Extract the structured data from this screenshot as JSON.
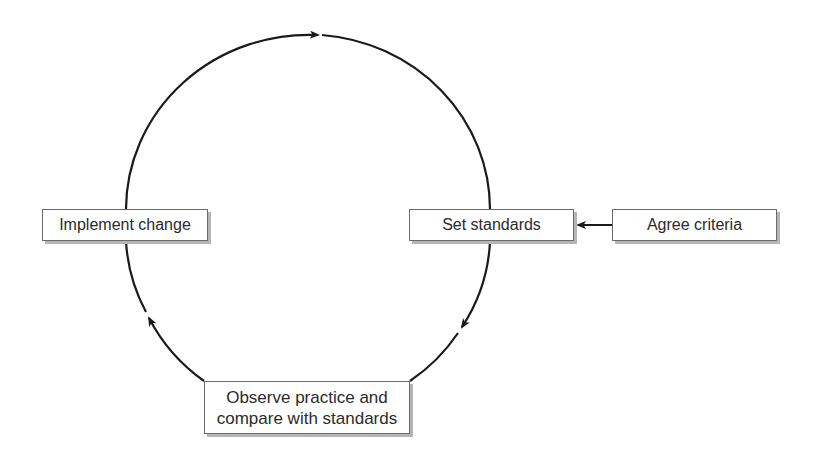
{
  "diagram": {
    "type": "cycle",
    "nodes": [
      {
        "id": "set_standards",
        "label": "Set standards"
      },
      {
        "id": "observe_practice",
        "label": "Observe practice and compare with standards",
        "lines": [
          "Observe practice and",
          "compare with standards"
        ]
      },
      {
        "id": "implement_change",
        "label": "Implement change"
      },
      {
        "id": "agree_criteria",
        "label": "Agree criteria"
      }
    ],
    "edges": [
      {
        "from": "agree_criteria",
        "to": "set_standards",
        "style": "straight-arrow"
      },
      {
        "from": "set_standards",
        "to": "observe_practice",
        "style": "circular-arc"
      },
      {
        "from": "observe_practice",
        "to": "implement_change",
        "style": "circular-arc"
      },
      {
        "from": "implement_change",
        "to": "set_standards",
        "style": "circular-arc"
      }
    ],
    "direction": "clockwise",
    "colors": {
      "line": "#1a1a1a",
      "box_border": "#6a6a6a",
      "box_shadow": "#b5b5b5",
      "text": "#2b2b2b",
      "background": "#ffffff"
    }
  }
}
